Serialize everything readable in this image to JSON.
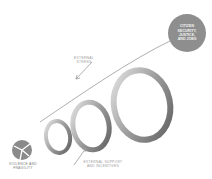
{
  "diagram": {
    "start": {
      "label_line1": "Violence and",
      "label_line2": "Fragility",
      "icon": "fractured-globe-icon"
    },
    "goal": {
      "line1": "Citizen",
      "line2": "Security,",
      "line3": "Justice,",
      "line4": "and Jobs"
    },
    "annotations": {
      "stress": {
        "line1": "External",
        "line2": "Stress"
      },
      "support": {
        "line1": "External Support",
        "line2": "and Incentives"
      }
    },
    "colors": {
      "ribbon": "#a8a8a8",
      "ribbon_dark": "#6e6e6e",
      "goal_circle": "#8e8e8e",
      "text": "#9a9a9a"
    }
  }
}
